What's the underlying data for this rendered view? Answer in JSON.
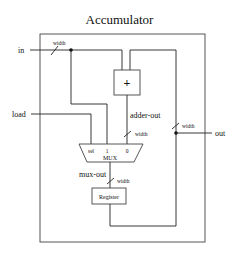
{
  "title": "Accumulator",
  "ports": {
    "in": "in",
    "load": "load",
    "out": "out"
  },
  "blocks": {
    "adder": "+",
    "mux": "MUX",
    "register": "Register"
  },
  "mux_inputs": {
    "sel": "sel",
    "one": "1",
    "zero": "0"
  },
  "signals": {
    "adder_out": "adder-out",
    "mux_out": "mux-out"
  },
  "bus_width_label": "width",
  "colors": {
    "line": "#222222",
    "background": "#ffffff"
  }
}
